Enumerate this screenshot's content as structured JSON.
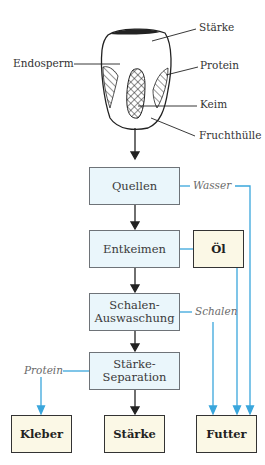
{
  "grain": {
    "labels": {
      "starch": "Stärke",
      "endosperm": "Endosperm",
      "protein": "Protein",
      "germ": "Keim",
      "hull": "Fruchthülle"
    }
  },
  "process_steps": [
    {
      "id": "swelling",
      "label": "Quellen"
    },
    {
      "id": "degermination",
      "label": "Entkeimen"
    },
    {
      "id": "hull-washing",
      "label_line1": "Schalen-",
      "label_line2": "Auswaschung"
    },
    {
      "id": "starch-separation",
      "label_line1": "Stärke-",
      "label_line2": "Separation"
    }
  ],
  "products": {
    "oil": "Öl",
    "gluten": "Kleber",
    "starch": "Stärke",
    "feed": "Futter"
  },
  "streams": {
    "water": "Wasser",
    "hulls": "Schalen",
    "protein": "Protein"
  },
  "colors": {
    "process_fill": "#eaf6fb",
    "product_fill": "#fbf8e6",
    "flow_line": "#3aa6dc",
    "main_arrow": "#222222"
  }
}
